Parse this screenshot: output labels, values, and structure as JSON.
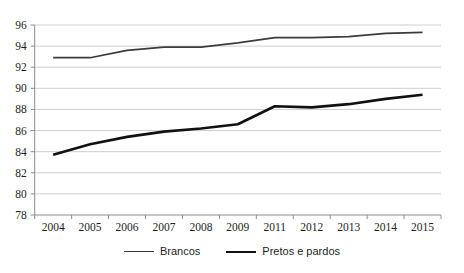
{
  "chart_data": {
    "type": "line",
    "title": "",
    "xlabel": "",
    "ylabel": "",
    "categories": [
      "2004",
      "2005",
      "2006",
      "2007",
      "2008",
      "2009",
      "2011",
      "2012",
      "2013",
      "2014",
      "2015"
    ],
    "ylim": [
      78,
      96
    ],
    "yticks": [
      78,
      80,
      82,
      84,
      86,
      88,
      90,
      92,
      94,
      96
    ],
    "grid": true,
    "legend_position": "bottom",
    "series": [
      {
        "name": "Brancos",
        "color": "#3b3b3b",
        "values": [
          92.9,
          92.9,
          93.6,
          93.9,
          93.9,
          94.3,
          94.8,
          94.8,
          94.9,
          95.2,
          95.3
        ]
      },
      {
        "name": "Pretos e pardos",
        "color": "#111111",
        "values": [
          83.7,
          84.7,
          85.4,
          85.9,
          86.2,
          86.6,
          88.3,
          88.2,
          88.5,
          89.0,
          89.4
        ]
      }
    ]
  },
  "legend": {
    "items": [
      {
        "label": "Brancos"
      },
      {
        "label": "Pretos e pardos"
      }
    ]
  }
}
